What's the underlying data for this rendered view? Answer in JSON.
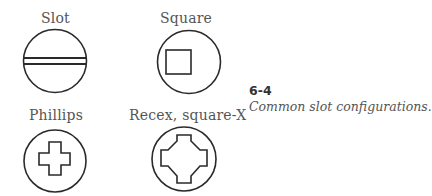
{
  "figure": {
    "number": "6-4",
    "caption": "Common slot configurations.",
    "items": [
      {
        "label": "Slot",
        "icon": "slot-head-icon"
      },
      {
        "label": "Square",
        "icon": "square-head-icon"
      },
      {
        "label": "Phillips",
        "icon": "phillips-head-icon"
      },
      {
        "label": "Recex, square-X",
        "icon": "recex-head-icon"
      }
    ]
  }
}
